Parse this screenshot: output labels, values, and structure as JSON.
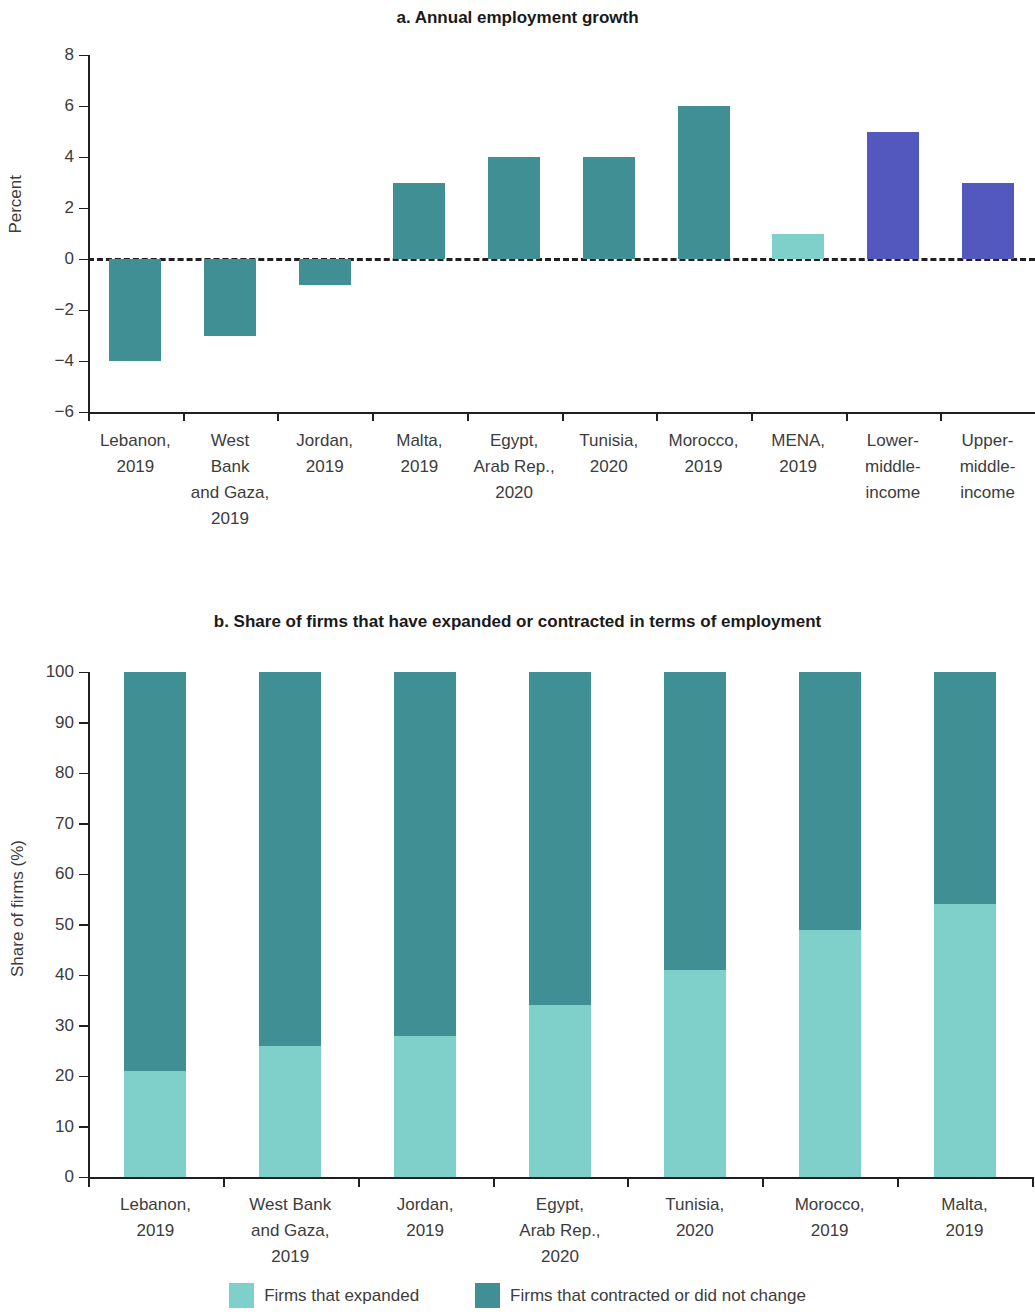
{
  "colors": {
    "teal_dark": "#3f8f95",
    "teal_mid": "#49949a",
    "teal_light": "#7fcfcb",
    "blue": "#5358be",
    "axis": "#231f20",
    "text": "#3c3c3c"
  },
  "panel_a": {
    "title": "a. Annual employment growth"
  },
  "panel_b": {
    "title": "b. Share of firms that have expanded or contracted in terms of employment",
    "legend": [
      {
        "label": "Firms that expanded",
        "color": "#7fcfcb"
      },
      {
        "label": "Firms that contracted or did not change",
        "color": "#3f8f95"
      }
    ]
  },
  "chart_data": [
    {
      "type": "bar",
      "title": "a. Annual employment growth",
      "xlabel": "",
      "ylabel": "Percent",
      "ylim": [
        -6,
        8
      ],
      "yticks": [
        8,
        6,
        4,
        2,
        0,
        -2,
        -4,
        -6
      ],
      "yticklabels": [
        "8",
        "6",
        "4",
        "2",
        "0",
        "−2",
        "−4",
        "−6"
      ],
      "grid": false,
      "zero_line": "dashed",
      "categories": [
        "Lebanon,\n2019",
        "West\nBank\nand Gaza,\n2019",
        "Jordan,\n2019",
        "Malta,\n2019",
        "Egypt,\nArab Rep.,\n2020",
        "Tunisia,\n2020",
        "Morocco,\n2019",
        "MENA,\n2019",
        "Lower-\nmiddle-\nincome",
        "Upper-\nmiddle-\nincome"
      ],
      "values": [
        -4,
        -3,
        -1,
        3,
        4,
        4,
        6,
        1,
        5,
        3
      ],
      "bar_colors": [
        "#3f8f95",
        "#3f8f95",
        "#3f8f95",
        "#3f8f95",
        "#3f8f95",
        "#3f8f95",
        "#3f8f95",
        "#7fcfcb",
        "#5358be",
        "#5358be"
      ]
    },
    {
      "type": "bar",
      "subtype": "stacked",
      "title": "b. Share of firms that have expanded or contracted in terms of employment",
      "xlabel": "",
      "ylabel": "Share of firms (%)",
      "ylim": [
        0,
        100
      ],
      "yticks": [
        100,
        90,
        80,
        70,
        60,
        50,
        40,
        30,
        20,
        10,
        0
      ],
      "yticklabels": [
        "100",
        "90",
        "80",
        "70",
        "60",
        "50",
        "40",
        "30",
        "20",
        "10",
        "0"
      ],
      "grid": false,
      "legend_position": "bottom",
      "categories": [
        "Lebanon,\n2019",
        "West Bank\nand Gaza,\n2019",
        "Jordan,\n2019",
        "Egypt,\nArab Rep.,\n2020",
        "Tunisia,\n2020",
        "Morocco,\n2019",
        "Malta,\n2019"
      ],
      "series": [
        {
          "name": "Firms that expanded",
          "color": "#7fcfcb",
          "values": [
            21,
            26,
            28,
            34,
            41,
            49,
            54
          ]
        },
        {
          "name": "Firms that contracted or did not change",
          "color": "#3f8f95",
          "values": [
            79,
            74,
            72,
            66,
            59,
            51,
            46
          ]
        }
      ]
    }
  ]
}
